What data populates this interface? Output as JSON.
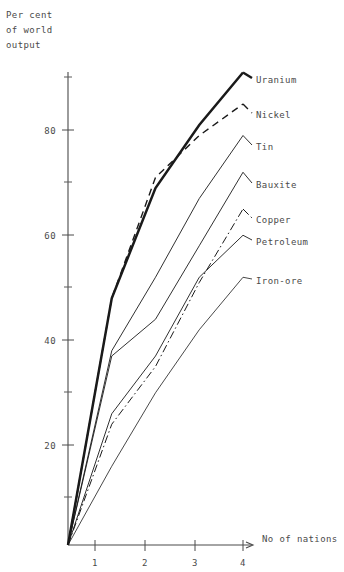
{
  "chart_data": {
    "type": "line",
    "title": "",
    "subtitle": "",
    "xlabel": "No of nations",
    "ylabel": "Per cent of world output",
    "ylabel_lines": [
      "Per cent",
      "of world",
      "output"
    ],
    "x": [
      0,
      1,
      2,
      3,
      4
    ],
    "xlim": [
      0,
      4.4
    ],
    "ylim": [
      0,
      95
    ],
    "x_ticks": [
      1,
      2,
      3,
      4
    ],
    "x_tick_labels": [
      "1",
      "2",
      "3",
      "4"
    ],
    "y_ticks": [
      20,
      40,
      60,
      80
    ],
    "y_tick_labels": [
      "20",
      "40",
      "60",
      "80"
    ],
    "y_minor_ticks": [
      10,
      30,
      50,
      70,
      90
    ],
    "grid": false,
    "legend_position": "right-inline-labels",
    "series": [
      {
        "name": "Uranium",
        "label": "Uranium",
        "style": "solid-bold",
        "values": [
          0,
          47,
          68,
          80,
          90
        ]
      },
      {
        "name": "Nickel",
        "label": "Nickel",
        "style": "dashed",
        "values": [
          0,
          47,
          70,
          78,
          84
        ]
      },
      {
        "name": "Tin",
        "label": "Tin",
        "style": "solid",
        "values": [
          0,
          37,
          51,
          66,
          78
        ]
      },
      {
        "name": "Bauxite",
        "label": "Bauxite",
        "style": "solid",
        "values": [
          0,
          36,
          43,
          57,
          71
        ]
      },
      {
        "name": "Copper",
        "label": "Copper",
        "style": "dash-dot",
        "values": [
          0,
          23,
          34,
          50,
          64
        ]
      },
      {
        "name": "Petroleum",
        "label": "Petroleum",
        "style": "solid",
        "values": [
          0,
          25,
          36,
          51,
          59
        ]
      },
      {
        "name": "Iron-ore",
        "label": "Iron-ore",
        "style": "solid-thin",
        "values": [
          0,
          15,
          29,
          41,
          51
        ]
      }
    ]
  },
  "axes": {
    "y_title_l1": "Per cent",
    "y_title_l2": "of world",
    "y_title_l3": "output",
    "x_title": "No of nations",
    "y_tick_80": "80",
    "y_tick_60": "60",
    "y_tick_40": "40",
    "y_tick_20": "20",
    "x_tick_1": "1",
    "x_tick_2": "2",
    "x_tick_3": "3",
    "x_tick_4": "4"
  },
  "labels": {
    "uranium": "Uranium",
    "nickel": "Nickel",
    "tin": "Tin",
    "bauxite": "Bauxite",
    "copper": "Copper",
    "petroleum": "Petroleum",
    "iron_ore": "Iron-ore"
  },
  "colors": {
    "ink": "#1a1a1a",
    "axis": "#4a4a4a",
    "background": "#ffffff"
  }
}
